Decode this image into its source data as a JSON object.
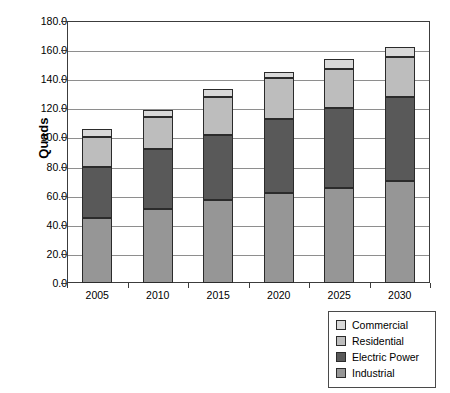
{
  "chart_data": {
    "type": "bar",
    "stacked": true,
    "title": "",
    "subtitle": "",
    "xlabel": "",
    "ylabel": "Quads",
    "categories": [
      "2005",
      "2010",
      "2015",
      "2020",
      "2025",
      "2030"
    ],
    "series": [
      {
        "name": "Industrial",
        "color": "#969696",
        "values": [
          45,
          51,
          57,
          62,
          65,
          70
        ]
      },
      {
        "name": "Electric Power",
        "color": "#595959",
        "values": [
          35,
          41,
          45,
          51,
          55,
          58
        ]
      },
      {
        "name": "Residential",
        "color": "#bdbdbd",
        "values": [
          20,
          22,
          26,
          28,
          27,
          27
        ]
      },
      {
        "name": "Commercial",
        "color": "#d9d9d9",
        "values": [
          6,
          5,
          5,
          4,
          7,
          7
        ]
      }
    ],
    "totals": [
      106,
      119,
      133,
      145,
      154,
      162
    ],
    "ylim": [
      0,
      180
    ],
    "ytick_step": 20,
    "ytick_labels": [
      "0.0",
      "20.0",
      "40.0",
      "60.0",
      "80.0",
      "100.0",
      "120.0",
      "140.0",
      "160.0",
      "180.0"
    ],
    "ytick_values": [
      0,
      20,
      40,
      60,
      80,
      100,
      120,
      140,
      160,
      180
    ],
    "grid": true,
    "grid_axis": "y",
    "legend_position": "bottom-right",
    "legend_order": [
      "Commercial",
      "Residential",
      "Electric Power",
      "Industrial"
    ],
    "stack_order_bottom_to_top": [
      "Industrial",
      "Electric Power",
      "Residential",
      "Commercial"
    ]
  },
  "legend": {
    "items": [
      {
        "label": "Commercial",
        "color": "#d9d9d9"
      },
      {
        "label": "Residential",
        "color": "#bdbdbd"
      },
      {
        "label": "Electric Power",
        "color": "#595959"
      },
      {
        "label": "Industrial",
        "color": "#969696"
      }
    ]
  },
  "colors": {
    "background": "#ffffff",
    "axis": "#3c3c3c",
    "gridline": "#8e8e8e",
    "bar_outline": "#2b2b2b"
  }
}
